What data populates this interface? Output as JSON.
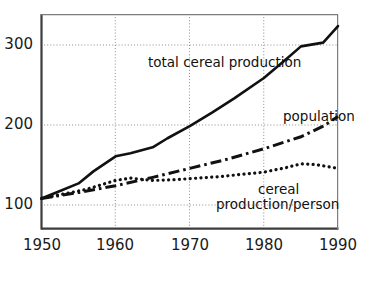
{
  "chart_data": {
    "type": "line",
    "title": "",
    "subtitle": "",
    "xlabel": "",
    "ylabel": "",
    "xlim": [
      1950,
      1990
    ],
    "ylim": [
      60,
      345
    ],
    "xticks": [
      1950,
      1960,
      1970,
      1980,
      1990
    ],
    "yticks": [
      100,
      200,
      300
    ],
    "grid": "dotted gridlines at y = 100, 200, 300 and x = 1960, 1970, 1980",
    "legend_position": "inline annotations next to curves",
    "index_note": "All series indexed to 100 in 1950",
    "series": [
      {
        "name": "total cereal production",
        "style": "solid",
        "x": [
          1950,
          1952,
          1955,
          1957,
          1960,
          1962,
          1965,
          1967,
          1970,
          1973,
          1976,
          1980,
          1983,
          1985,
          1988,
          1990
        ],
        "values": [
          100,
          108,
          120,
          136,
          156,
          160,
          168,
          180,
          196,
          214,
          233,
          260,
          285,
          302,
          307,
          329
        ]
      },
      {
        "name": "population",
        "style": "dash-dot",
        "x": [
          1950,
          1955,
          1960,
          1965,
          1970,
          1975,
          1980,
          1985,
          1988,
          1990
        ],
        "values": [
          100,
          108,
          117,
          128,
          140,
          152,
          166,
          182,
          196,
          209
        ]
      },
      {
        "name": "cereal production/person",
        "style": "dotted",
        "x": [
          1950,
          1953,
          1956,
          1960,
          1962,
          1965,
          1968,
          1971,
          1974,
          1977,
          1980,
          1983,
          1985,
          1987,
          1990
        ],
        "values": [
          100,
          106,
          112,
          124,
          127,
          124,
          125,
          127,
          129,
          132,
          135,
          141,
          146,
          145,
          140
        ]
      }
    ]
  },
  "axes": {
    "y_tick_labels": [
      "300",
      "200",
      "100"
    ],
    "x_tick_labels": [
      "1950",
      "1960",
      "1970",
      "1980",
      "1990"
    ]
  },
  "annotations": [
    {
      "id": "total-cereal-production",
      "text": "total cereal production"
    },
    {
      "id": "population",
      "text": "population"
    },
    {
      "id": "cereal-production-per-person-line1",
      "text": "cereal"
    },
    {
      "id": "cereal-production-per-person-line2",
      "text": "production/person"
    }
  ],
  "colors": {
    "line": "#111111",
    "axis": "#4a4a4a",
    "grid": "#9a9a9a",
    "background": "#ffffff",
    "text": "#1a1a1a"
  }
}
